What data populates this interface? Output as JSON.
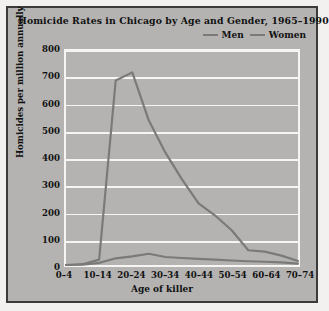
{
  "chart_data": {
    "type": "line",
    "title": "Homicide Rates in Chicago by Age and Gender, 1965–1990",
    "xlabel": "Age of killer",
    "ylabel": "Homicides per million annually",
    "categories": [
      "0–4",
      "5–9",
      "10–14",
      "15–19",
      "20–24",
      "25–29",
      "30–34",
      "35–39",
      "40–44",
      "45–49",
      "50–54",
      "55–59",
      "60–64",
      "65–69",
      "70–74"
    ],
    "tick_labels": [
      "0–4",
      "10–14",
      "20–24",
      "30–34",
      "40–44",
      "50–54",
      "60–64",
      "70–74"
    ],
    "series": [
      {
        "name": "Men",
        "color": "#7a7a7a",
        "values": [
          0,
          3,
          20,
          690,
          720,
          540,
          420,
          320,
          230,
          185,
          130,
          55,
          50,
          35,
          15
        ]
      },
      {
        "name": "Women",
        "color": "#7a7a7a",
        "values": [
          0,
          1,
          8,
          25,
          32,
          42,
          30,
          26,
          23,
          20,
          17,
          14,
          12,
          10,
          5
        ]
      }
    ],
    "ylim": [
      0,
      800
    ],
    "yticks": [
      0,
      100,
      200,
      300,
      400,
      500,
      600,
      700,
      800
    ],
    "grid": true,
    "legend_position": "top-right",
    "background_color": "#b4b3b1",
    "gridline_color": "#f6f5f3"
  },
  "legend": {
    "entries": [
      {
        "label": "Men"
      },
      {
        "label": "Women"
      }
    ]
  }
}
